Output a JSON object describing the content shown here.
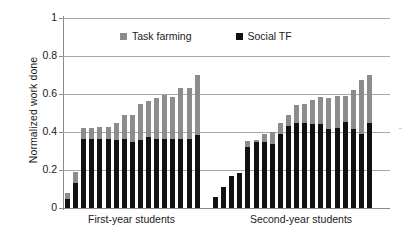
{
  "chart_data": {
    "type": "bar",
    "subtype": "stacked-bar",
    "title": "",
    "xlabel": "",
    "ylabel": "Normalized work done",
    "ylim": [
      0,
      1
    ],
    "yticks": [
      0,
      0.2,
      0.4,
      0.6,
      0.8,
      1
    ],
    "ytick_labels": [
      "0",
      "0.2",
      "0.4",
      "0.6",
      "0.8",
      "1"
    ],
    "grid": true,
    "legend_position": "inside-top-center",
    "series": [
      {
        "name": "Social TF",
        "color": "#111111",
        "stack_order": "bottom",
        "values": [
          0.05,
          0.13,
          0.365,
          0.365,
          0.365,
          0.365,
          0.36,
          0.365,
          0.35,
          0.36,
          0.375,
          0.365,
          0.365,
          0.365,
          0.365,
          0.365,
          0.385,
          0.06,
          0.11,
          0.17,
          0.185,
          0.32,
          0.345,
          0.35,
          0.335,
          0.39,
          0.43,
          0.445,
          0.445,
          0.44,
          0.44,
          0.415,
          0.42,
          0.455,
          0.415,
          0.39,
          0.45
        ]
      },
      {
        "name": "Task farming",
        "color": "#8c8c8c",
        "stack_order": "top",
        "values": [
          0.03,
          0.06,
          0.055,
          0.055,
          0.06,
          0.06,
          0.09,
          0.125,
          0.14,
          0.185,
          0.19,
          0.215,
          0.23,
          0.22,
          0.265,
          0.265,
          0.315,
          0.0,
          0.0,
          0.0,
          0.0,
          0.035,
          0.015,
          0.04,
          0.065,
          0.055,
          0.06,
          0.095,
          0.105,
          0.13,
          0.145,
          0.165,
          0.17,
          0.135,
          0.205,
          0.285,
          0.25
        ]
      }
    ],
    "totals": [
      0.08,
      0.19,
      0.42,
      0.42,
      0.425,
      0.425,
      0.45,
      0.49,
      0.49,
      0.545,
      0.565,
      0.58,
      0.595,
      0.585,
      0.63,
      0.63,
      0.7,
      0.06,
      0.11,
      0.17,
      0.185,
      0.355,
      0.36,
      0.39,
      0.4,
      0.445,
      0.49,
      0.54,
      0.55,
      0.57,
      0.585,
      0.58,
      0.59,
      0.59,
      0.62,
      0.675,
      0.7
    ],
    "groups": [
      {
        "label": "First-year students",
        "bar_count": 17
      },
      {
        "label": "Second-year students",
        "bar_count": 20
      }
    ]
  },
  "legend": {
    "entries": [
      {
        "label": "Task farming",
        "color": "#8c8c8c",
        "swatch_name": "task-farming-swatch"
      },
      {
        "label": "Social TF",
        "color": "#111111",
        "swatch_name": "social-tf-swatch"
      }
    ]
  },
  "axes": {
    "y_title": "Normalized work done",
    "y_tick_labels": [
      "1",
      "0.8",
      "0.6",
      "0.4",
      "0.2",
      "0"
    ],
    "group_labels": [
      "First-year students",
      "Second-year students"
    ]
  },
  "colors": {
    "task_farming": "#8c8c8c",
    "social_tf": "#111111",
    "gridline": "#a8a8a8",
    "axis": "#8a8a8a",
    "background": "#ffffff",
    "text": "#1a1a1a"
  }
}
